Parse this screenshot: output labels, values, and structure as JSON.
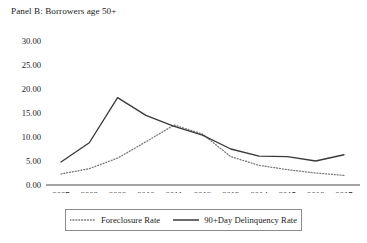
{
  "figure": {
    "panel_title": "Panel B: Borrowers age 50+"
  },
  "legend": {
    "position": "bottom-center",
    "entries": [
      {
        "label": "Foreclosure Rate",
        "style": "dotted",
        "color": "#7a7a7a",
        "swatch_name": "dotted-line-swatch"
      },
      {
        "label": "90+Day Delinquency Rate",
        "style": "solid",
        "color": "#3a3a3a",
        "swatch_name": "solid-line-swatch"
      }
    ]
  },
  "axes": {
    "y_tick_labels": [
      "30.00",
      "25.00",
      "20.00",
      "15.00",
      "10.00",
      "5.00",
      "0.00"
    ],
    "x_tick_labels": [
      "2007",
      "2008",
      "2009",
      "2010",
      "2011",
      "2012",
      "2013",
      "2014",
      "2015",
      "2016",
      "2017"
    ]
  },
  "chart_data": {
    "type": "line",
    "title": "Panel B: Borrowers age 50+",
    "xlabel": "",
    "ylabel": "",
    "x": [
      2007,
      2008,
      2009,
      2010,
      2011,
      2012,
      2013,
      2014,
      2015,
      2016,
      2017
    ],
    "categories": [
      "2007",
      "2008",
      "2009",
      "2010",
      "2011",
      "2012",
      "2013",
      "2014",
      "2015",
      "2016",
      "2017"
    ],
    "ylim": [
      0,
      30
    ],
    "yticks": [
      0,
      5,
      10,
      15,
      20,
      25,
      30
    ],
    "ytick_format": "0.00",
    "grid": false,
    "legend_position": "bottom-center",
    "series": [
      {
        "name": "Foreclosure Rate",
        "style": "dotted",
        "color": "#7a7a7a",
        "values": [
          2.3,
          3.4,
          5.6,
          9.0,
          12.5,
          10.6,
          5.9,
          4.1,
          3.2,
          2.5,
          2.0
        ]
      },
      {
        "name": "90+Day Delinquency Rate",
        "style": "solid",
        "color": "#3a3a3a",
        "values": [
          4.8,
          8.8,
          18.2,
          14.5,
          12.2,
          10.4,
          7.5,
          6.0,
          5.9,
          5.0,
          6.3
        ]
      }
    ]
  }
}
